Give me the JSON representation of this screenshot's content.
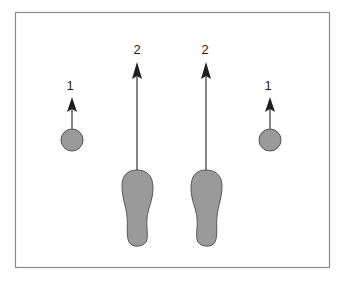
{
  "diagram": {
    "colors": {
      "frame": "#8a8a8a",
      "fill": "#9a9a9a",
      "stroke": "#555555",
      "arrow": "#1f1f1f",
      "background": "#ffffff"
    },
    "labels": {
      "left_ball": "1",
      "left_foot": "2",
      "right_foot": "2",
      "right_ball": "1"
    },
    "elements": [
      {
        "name": "left-ball",
        "shape": "circle",
        "label": "1"
      },
      {
        "name": "left-footprint",
        "shape": "footprint",
        "label": "2"
      },
      {
        "name": "right-footprint",
        "shape": "footprint",
        "label": "2"
      },
      {
        "name": "right-ball",
        "shape": "circle",
        "label": "1"
      }
    ]
  }
}
